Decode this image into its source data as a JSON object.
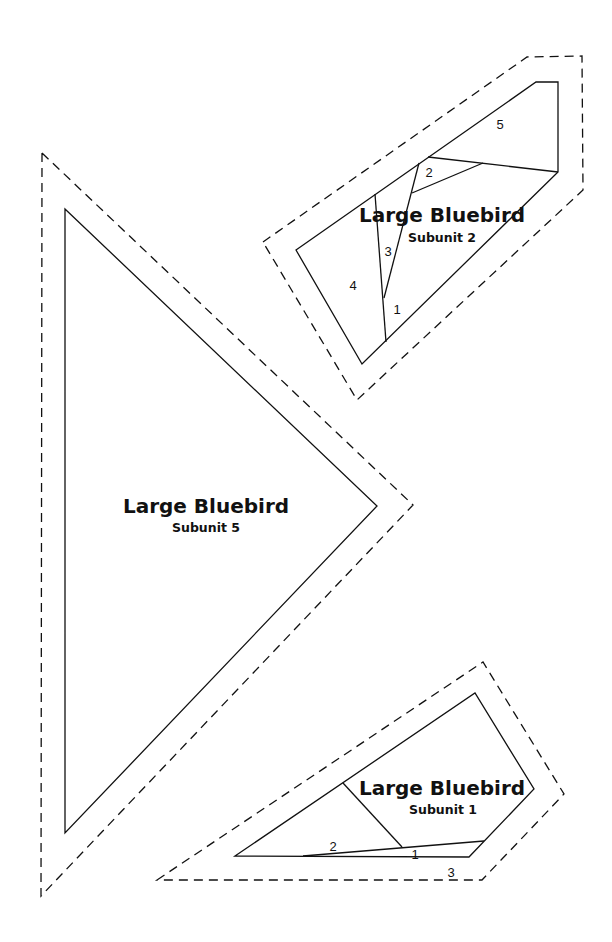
{
  "pattern_pieces": [
    {
      "id": "subunit-5",
      "title": "Large Bluebird",
      "subtitle": "Subunit 5",
      "sections": []
    },
    {
      "id": "subunit-2",
      "title": "Large Bluebird",
      "subtitle": "Subunit 2",
      "sections": [
        "1",
        "2",
        "3",
        "4",
        "5"
      ]
    },
    {
      "id": "subunit-1",
      "title": "Large Bluebird",
      "subtitle": "Subunit 1",
      "sections": [
        "1",
        "2",
        "3"
      ]
    }
  ],
  "colors": {
    "line": "#111111",
    "background": "#ffffff"
  }
}
